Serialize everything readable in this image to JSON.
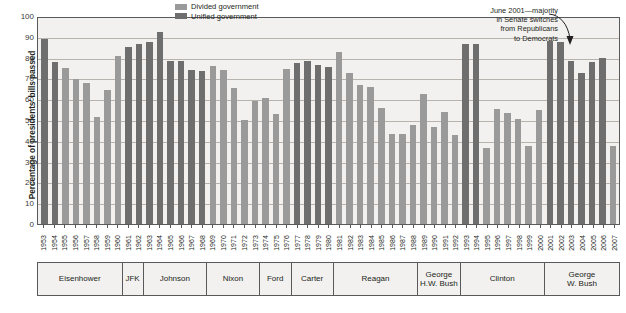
{
  "chart_data": {
    "type": "bar",
    "title": "",
    "xlabel": "",
    "ylabel": "Percentage of presidents' bills passed",
    "ylim": [
      0,
      100
    ],
    "ytick_labels": [
      "100",
      "90",
      "80",
      "70",
      "60",
      "50",
      "40",
      "30",
      "20",
      "10",
      "0"
    ],
    "ytick_values": [
      100,
      90,
      80,
      70,
      60,
      50,
      40,
      30,
      20,
      10,
      0
    ],
    "grid": true,
    "legend_position": "top-center",
    "legend": [
      {
        "label": "Divided government",
        "color": "#9a9a9a",
        "key": "divided"
      },
      {
        "label": "Unified government",
        "color": "#6e6e6e",
        "key": "unified"
      }
    ],
    "annotations": [
      {
        "text": "June 2001—majority in Senate switches from Republicans to Democrats",
        "lines": [
          "June 2001—majority",
          "in Senate switches",
          "from Republicans",
          "to Democrats"
        ],
        "points_to_year": "2001"
      }
    ],
    "categories": [
      "1953",
      "1954",
      "1955",
      "1956",
      "1957",
      "1958",
      "1959",
      "1960",
      "1961",
      "1962",
      "1963",
      "1964",
      "1965",
      "1966",
      "1967",
      "1968",
      "1969",
      "1970",
      "1971",
      "1972",
      "1973",
      "1974",
      "1975",
      "1976",
      "1977",
      "1978",
      "1979",
      "1980",
      "1981",
      "1982",
      "1983",
      "1984",
      "1985",
      "1986",
      "1987",
      "1988",
      "1989",
      "1990",
      "1991",
      "1992",
      "1993",
      "1994",
      "1995",
      "1996",
      "1997",
      "1998",
      "1999",
      "2000",
      "2001",
      "2002",
      "2003",
      "2004",
      "2005",
      "2006",
      "2007"
    ],
    "values": [
      89,
      78,
      75,
      69.5,
      68,
      51.5,
      64.5,
      81,
      85,
      86.5,
      87.5,
      92.5,
      78.5,
      78.5,
      74,
      73.5,
      76,
      74,
      65.5,
      50,
      59,
      60.5,
      53,
      74.5,
      77.5,
      78.5,
      76.5,
      75.5,
      82.5,
      72.5,
      67,
      66,
      56,
      43.5,
      43.5,
      47.5,
      62.5,
      46.5,
      54,
      43,
      86.5,
      86.5,
      36.5,
      55.5,
      53.5,
      50.5,
      37.5,
      55,
      88,
      87.5,
      78.5,
      72.5,
      78,
      80,
      37.5
    ],
    "government_type": [
      "unified",
      "unified",
      "divided",
      "divided",
      "divided",
      "divided",
      "divided",
      "divided",
      "unified",
      "unified",
      "unified",
      "unified",
      "unified",
      "unified",
      "unified",
      "unified",
      "divided",
      "divided",
      "divided",
      "divided",
      "divided",
      "divided",
      "divided",
      "divided",
      "unified",
      "unified",
      "unified",
      "unified",
      "divided",
      "divided",
      "divided",
      "divided",
      "divided",
      "divided",
      "divided",
      "divided",
      "divided",
      "divided",
      "divided",
      "divided",
      "unified",
      "unified",
      "divided",
      "divided",
      "divided",
      "divided",
      "divided",
      "divided",
      "unified",
      "unified",
      "unified",
      "unified",
      "unified",
      "unified",
      "divided"
    ],
    "presidents": [
      {
        "name": "Eisenhower",
        "lines": [
          "Eisenhower"
        ],
        "start_year": "1953",
        "end_year": "1960",
        "span": 8
      },
      {
        "name": "JFK",
        "lines": [
          "JFK"
        ],
        "start_year": "1961",
        "end_year": "1962",
        "span": 2
      },
      {
        "name": "Johnson",
        "lines": [
          "Johnson"
        ],
        "start_year": "1963",
        "end_year": "1968",
        "span": 6
      },
      {
        "name": "Nixon",
        "lines": [
          "Nixon"
        ],
        "start_year": "1969",
        "end_year": "1973",
        "span": 5
      },
      {
        "name": "Ford",
        "lines": [
          "Ford"
        ],
        "start_year": "1974",
        "end_year": "1976",
        "span": 3
      },
      {
        "name": "Carter",
        "lines": [
          "Carter"
        ],
        "start_year": "1977",
        "end_year": "1980",
        "span": 4
      },
      {
        "name": "Reagan",
        "lines": [
          "Reagan"
        ],
        "start_year": "1981",
        "end_year": "1988",
        "span": 8
      },
      {
        "name": "George H.W. Bush",
        "lines": [
          "George",
          "H.W. Bush"
        ],
        "start_year": "1989",
        "end_year": "1992",
        "span": 4
      },
      {
        "name": "Clinton",
        "lines": [
          "Clinton"
        ],
        "start_year": "1993",
        "end_year": "2000",
        "span": 8
      },
      {
        "name": "George W. Bush",
        "lines": [
          "George",
          "W. Bush"
        ],
        "start_year": "2001",
        "end_year": "2007",
        "span": 7
      }
    ]
  }
}
